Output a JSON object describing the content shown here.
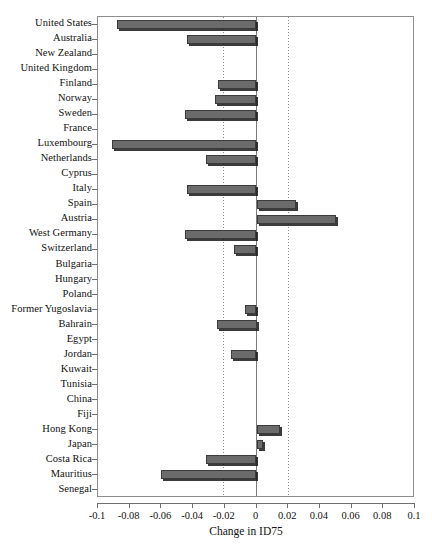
{
  "chart_data": {
    "type": "bar",
    "orientation": "horizontal",
    "title": "",
    "xlabel": "Change in ID75",
    "ylabel": "",
    "xlim": [
      -0.1,
      0.1
    ],
    "xticks": [
      -0.1,
      -0.08,
      -0.06,
      -0.04,
      -0.02,
      0,
      0.02,
      0.04,
      0.06,
      0.08,
      0.1
    ],
    "xticklabels": [
      "-0.1",
      "-0.08",
      "-0.06",
      "-0.04",
      "-0.02",
      "0",
      "0.02",
      "0.04",
      "0.06",
      "0.08",
      "0.1"
    ],
    "grid": false,
    "reference_lines": [
      -0.02,
      0,
      0.02
    ],
    "legend": null,
    "bar_color": "#6b6b6b",
    "categories": [
      "United States",
      "Australia",
      "New Zealand",
      "United Kingdom",
      "Finland",
      "Norway",
      "Sweden",
      "France",
      "Luxembourg",
      "Netherlands",
      "Cyprus",
      "Italy",
      "Spain",
      "Austria",
      "West Germany",
      "Switzerland",
      "Bulgaria",
      "Hungary",
      "Poland",
      "Former Yugoslavia",
      "Bahrain",
      "Egypt",
      "Jordan",
      "Kuwait",
      "Tunisia",
      "China",
      "Fiji",
      "Hong Kong",
      "Japan",
      "Costa Rica",
      "Mauritius",
      "Senegal"
    ],
    "values": [
      -0.088,
      -0.044,
      0.0,
      0.0,
      -0.024,
      -0.026,
      -0.045,
      0.0,
      -0.091,
      -0.032,
      0.0,
      -0.044,
      0.025,
      0.05,
      -0.045,
      -0.014,
      0.0,
      0.0,
      0.0,
      -0.007,
      -0.025,
      0.0,
      -0.016,
      0.0,
      0.0,
      0.0,
      0.0,
      0.015,
      0.004,
      -0.032,
      -0.06,
      0.0
    ]
  }
}
